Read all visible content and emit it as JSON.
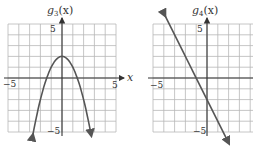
{
  "chart_data": [
    {
      "type": "line",
      "title": "g3(x)",
      "title_parts": {
        "name": "g",
        "subscript": "3",
        "arg": "(x)"
      },
      "function": "g3(x) = -x^2 + 2",
      "xlabel": "x",
      "ylabel": "g3(x)",
      "xlim": [
        -5,
        5
      ],
      "ylim": [
        -5,
        5
      ],
      "grid": true,
      "x_tick_labels": [
        "-5",
        "5"
      ],
      "y_tick_labels": [
        "5",
        "-5"
      ],
      "points": [
        [
          -2.7,
          -5.29
        ],
        [
          -2.5,
          -4.25
        ],
        [
          -2,
          -2
        ],
        [
          -1.5,
          -0.25
        ],
        [
          -1,
          1
        ],
        [
          -0.5,
          1.75
        ],
        [
          0,
          2
        ],
        [
          0.5,
          1.75
        ],
        [
          1,
          1
        ],
        [
          1.5,
          -0.25
        ],
        [
          2,
          -2
        ],
        [
          2.5,
          -4.25
        ],
        [
          2.7,
          -5.29
        ]
      ],
      "vertex": [
        0,
        2
      ],
      "end_arrows": true
    },
    {
      "type": "line",
      "title": "g4(x)",
      "title_parts": {
        "name": "g",
        "subscript": "4",
        "arg": "(x)"
      },
      "function": "g4(x) = -2x - 2",
      "xlabel": "",
      "ylabel": "g4(x)",
      "xlim": [
        -5,
        5
      ],
      "ylim": [
        -5,
        5
      ],
      "grid": true,
      "x_tick_labels": [
        "-5"
      ],
      "y_tick_labels": [
        "5",
        "-5"
      ],
      "points": [
        [
          -3.9,
          5.8
        ],
        [
          2.0,
          -6.0
        ]
      ],
      "y_intercept": -2,
      "x_intercept": -1,
      "slope": -2,
      "end_arrows": true
    }
  ],
  "labels": {
    "g3": {
      "name": "g",
      "sub": "3",
      "arg": "(x)"
    },
    "g4": {
      "name": "g",
      "sub": "4",
      "arg": "(x)"
    },
    "x_axis": "x",
    "neg5": "−5",
    "pos5": "5"
  }
}
